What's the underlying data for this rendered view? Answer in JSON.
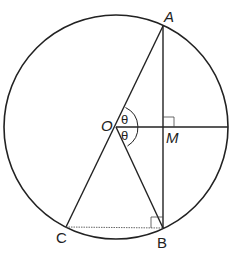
{
  "diagram": {
    "points": {
      "O": {
        "label": "O",
        "x": 116,
        "y": 127
      },
      "A": {
        "label": "A",
        "x": 163,
        "y": 26
      },
      "B": {
        "label": "B",
        "x": 163,
        "y": 228
      },
      "C": {
        "label": "C",
        "x": 66,
        "y": 227
      },
      "M": {
        "label": "M",
        "x": 163,
        "y": 127
      }
    },
    "angles": [
      {
        "label": "θ",
        "between": [
          "OA",
          "OM"
        ]
      },
      {
        "label": "θ",
        "between": [
          "OM",
          "OB"
        ]
      }
    ],
    "right_angles": [
      "M",
      "B"
    ],
    "circle": {
      "cx": 116,
      "cy": 127,
      "r": 112
    },
    "colors": {
      "stroke": "#222222",
      "background": "#ffffff"
    }
  }
}
